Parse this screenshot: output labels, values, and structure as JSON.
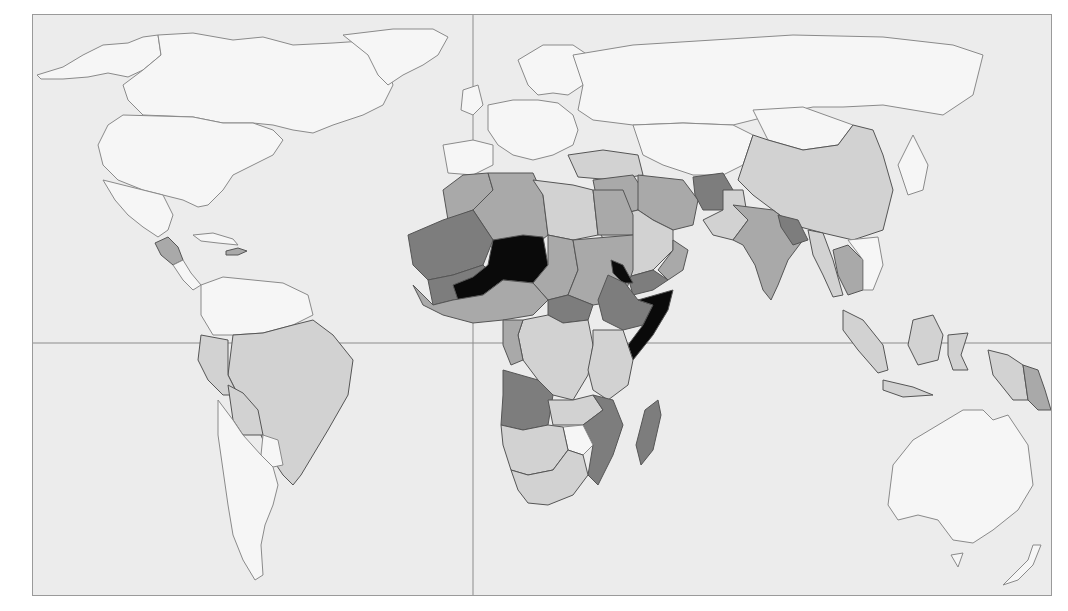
{
  "map": {
    "type": "choropleth-world-map",
    "projection": "equirectangular-like",
    "labels": [],
    "legend": null,
    "grid": {
      "prime_meridian_x": 440,
      "equator_y": 328
    },
    "colors": {
      "background": "#ececec",
      "no_data_white": "#f6f6f6",
      "level_1_light": "#d2d2d2",
      "level_2_medium": "#a9a9a9",
      "level_3_dark": "#7d7d7d",
      "level_4_black": "#0a0a0a",
      "border": "#555555",
      "frame": "#9a9a9a"
    },
    "shading_levels": [
      "white",
      "light grey",
      "medium grey",
      "dark grey",
      "black"
    ],
    "regions": [
      {
        "name": "north-america",
        "level": "white"
      },
      {
        "name": "greenland",
        "level": "white"
      },
      {
        "name": "guatemala-honduras",
        "level": "medium grey"
      },
      {
        "name": "haiti",
        "level": "medium grey"
      },
      {
        "name": "venezuela-colombia",
        "level": "white"
      },
      {
        "name": "brazil",
        "level": "light grey"
      },
      {
        "name": "peru",
        "level": "light grey"
      },
      {
        "name": "bolivia",
        "level": "light grey"
      },
      {
        "name": "paraguay",
        "level": "white"
      },
      {
        "name": "chile-argentina",
        "level": "white"
      },
      {
        "name": "europe",
        "level": "white"
      },
      {
        "name": "russia",
        "level": "white"
      },
      {
        "name": "turkey",
        "level": "light grey"
      },
      {
        "name": "morocco",
        "level": "medium grey"
      },
      {
        "name": "algeria",
        "level": "medium grey"
      },
      {
        "name": "libya",
        "level": "light grey"
      },
      {
        "name": "egypt",
        "level": "medium grey"
      },
      {
        "name": "mauritania",
        "level": "dark grey"
      },
      {
        "name": "mali",
        "level": "dark grey"
      },
      {
        "name": "niger",
        "level": "black"
      },
      {
        "name": "burkina-faso",
        "level": "black"
      },
      {
        "name": "chad",
        "level": "medium grey"
      },
      {
        "name": "sudan",
        "level": "medium grey"
      },
      {
        "name": "eritrea",
        "level": "black"
      },
      {
        "name": "ethiopia",
        "level": "dark grey"
      },
      {
        "name": "somalia",
        "level": "black"
      },
      {
        "name": "nigeria",
        "level": "medium grey"
      },
      {
        "name": "central-african-republic",
        "level": "dark grey"
      },
      {
        "name": "drc",
        "level": "light grey"
      },
      {
        "name": "kenya-tanzania",
        "level": "light grey"
      },
      {
        "name": "angola",
        "level": "dark grey"
      },
      {
        "name": "zambia",
        "level": "light grey"
      },
      {
        "name": "mozambique",
        "level": "dark grey"
      },
      {
        "name": "zimbabwe",
        "level": "white"
      },
      {
        "name": "namibia-botswana",
        "level": "light grey"
      },
      {
        "name": "south-africa",
        "level": "light grey"
      },
      {
        "name": "madagascar",
        "level": "dark grey"
      },
      {
        "name": "saudi-arabia",
        "level": "light grey"
      },
      {
        "name": "yemen",
        "level": "dark grey"
      },
      {
        "name": "oman",
        "level": "medium grey"
      },
      {
        "name": "iraq-syria",
        "level": "medium grey"
      },
      {
        "name": "iran",
        "level": "medium grey"
      },
      {
        "name": "afghanistan",
        "level": "dark grey"
      },
      {
        "name": "pakistan",
        "level": "light grey"
      },
      {
        "name": "india",
        "level": "medium grey"
      },
      {
        "name": "nepal-bangladesh",
        "level": "dark grey"
      },
      {
        "name": "china",
        "level": "light grey"
      },
      {
        "name": "mongolia",
        "level": "white"
      },
      {
        "name": "kazakhstan-central-asia",
        "level": "white"
      },
      {
        "name": "myanmar",
        "level": "light grey"
      },
      {
        "name": "laos-cambodia",
        "level": "medium grey"
      },
      {
        "name": "indonesia",
        "level": "light grey"
      },
      {
        "name": "papua-new-guinea",
        "level": "medium grey"
      },
      {
        "name": "japan",
        "level": "white"
      },
      {
        "name": "australia",
        "level": "white"
      },
      {
        "name": "new-zealand",
        "level": "white"
      }
    ]
  }
}
